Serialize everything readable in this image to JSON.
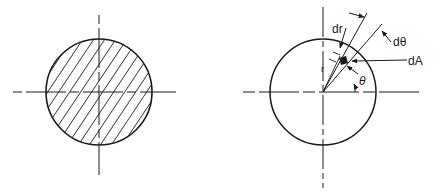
{
  "figure": {
    "left_diagram": {
      "description": "Solid circular cross-section with hatching and centerlines",
      "center": [
        99,
        92
      ],
      "radius": 53
    },
    "right_diagram": {
      "description": "Circular section with polar differential element",
      "center": [
        323,
        92
      ],
      "radius": 53,
      "labels": {
        "dr": "dr",
        "dtheta": "dθ",
        "dA": "dA",
        "theta": "θ",
        "r": "r"
      }
    },
    "colors": {
      "ink": "#1a1a1a",
      "background": "#ffffff"
    }
  }
}
